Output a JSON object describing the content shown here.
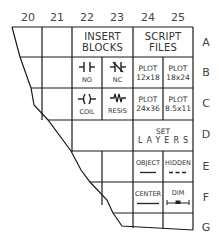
{
  "columns": [
    "20",
    "21",
    "22",
    "23",
    "24",
    "25"
  ],
  "rows": [
    "A",
    "B",
    "C",
    "D",
    "E",
    "F",
    "G"
  ],
  "cells": {
    "insert_blocks": {
      "line1": "INSERT",
      "line2": "BLOCKS"
    },
    "script_files": {
      "line1": "SCRIPT",
      "line2": "FILES"
    },
    "no": {
      "label": "NO",
      "icon": "normally-open-contact-icon"
    },
    "nc": {
      "label": "NC",
      "icon": "normally-closed-contact-icon"
    },
    "coil": {
      "label": "COIL",
      "icon": "coil-icon"
    },
    "resis": {
      "label": "RESIS",
      "icon": "resistor-icon"
    },
    "plot_12x18": {
      "line1": "PLOT",
      "line2": "12x18"
    },
    "plot_18x24": {
      "line1": "PLOT",
      "line2": "18x24"
    },
    "plot_24x36": {
      "line1": "PLOT",
      "line2": "24x36"
    },
    "plot_8_5x11": {
      "line1": "PLOT",
      "line2": "8.5x11"
    },
    "set_layers": {
      "line1": "SET",
      "line2": "LAYERS"
    },
    "object": {
      "label": "OBJECT",
      "icon": "continuous-line-icon"
    },
    "hidden": {
      "label": "HIDDEN",
      "icon": "dashed-line-icon"
    },
    "center": {
      "label": "CENTER",
      "icon": "center-line-icon"
    },
    "dim": {
      "label": "DIM",
      "icon": "dimension-icon"
    }
  },
  "colors": {
    "line": "#1a1a1a",
    "text": "#333333",
    "background": "#ffffff"
  }
}
